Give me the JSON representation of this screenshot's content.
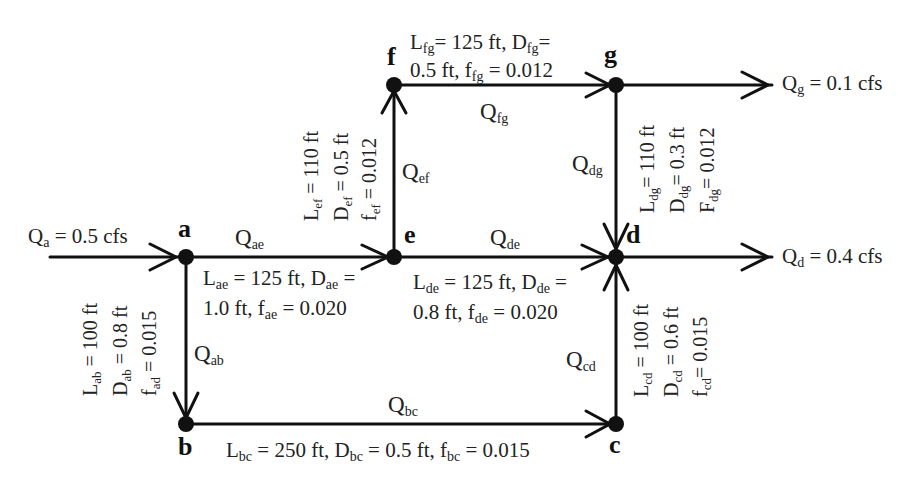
{
  "diagram": {
    "type": "pipe-network",
    "nodes": [
      {
        "id": "a",
        "label": "a"
      },
      {
        "id": "b",
        "label": "b"
      },
      {
        "id": "c",
        "label": "c"
      },
      {
        "id": "d",
        "label": "d"
      },
      {
        "id": "e",
        "label": "e"
      },
      {
        "id": "f",
        "label": "f"
      },
      {
        "id": "g",
        "label": "g"
      }
    ],
    "inflow": {
      "node": "a",
      "label": "Q",
      "sub": "a",
      "value": " = 0.5 cfs"
    },
    "outflows": [
      {
        "node": "g",
        "label": "Q",
        "sub": "g",
        "value": " = 0.1 cfs"
      },
      {
        "node": "d",
        "label": "Q",
        "sub": "d",
        "value": " = 0.4 cfs"
      }
    ],
    "pipes": {
      "ae": {
        "flow": "Q",
        "flow_sub": "ae",
        "from": "a",
        "to": "e",
        "line1_L": "L",
        "line1_Lsub": "ae",
        "line1_Lval": " = 125 ft, D",
        "line1_Dsub": "ae",
        "line1_Dval": " =",
        "line2_Dval": "1.0 ft, f",
        "line2_fsub": "ae",
        "line2_fval": " = 0.020"
      },
      "de": {
        "flow": "Q",
        "flow_sub": "de",
        "from": "e",
        "to": "d",
        "line1_L": "L",
        "line1_Lsub": "de",
        "line1_Lval": " = 125 ft, D",
        "line1_Dsub": "de",
        "line1_Dval": " =",
        "line2_Dval": "0.8 ft, f",
        "line2_fsub": "de",
        "line2_fval": " = 0.020"
      },
      "fg": {
        "flow": "Q",
        "flow_sub": "fg",
        "from": "f",
        "to": "g",
        "line1_L": "L",
        "line1_Lsub": "fg",
        "line1_Lval": "= 125 ft, D",
        "line1_Dsub": "fg",
        "line1_Dval": "=",
        "line2_Dval": "0.5 ft, f",
        "line2_fsub": "fg",
        "line2_fval": " = 0.012"
      },
      "bc": {
        "flow": "Q",
        "flow_sub": "bc",
        "from": "b",
        "to": "c",
        "L": "L",
        "Lsub": "bc",
        "Lval": " = 250 ft, D",
        "Dsub": "bc",
        "Dval": " = 0.5 ft, f",
        "fsub": "bc",
        "fval": " = 0.015"
      },
      "ab": {
        "flow": "Q",
        "flow_sub": "ab",
        "from": "a",
        "to": "b",
        "L": "L",
        "Lsub": "ab",
        "Lval": " = 100 ft",
        "D": "D",
        "Dsub": "ab",
        "Dval": " = 0.8 ft",
        "f": "f",
        "fsub": "ad",
        "fval": " = 0.015"
      },
      "ef": {
        "flow": "Q",
        "flow_sub": "ef",
        "from": "e",
        "to": "f",
        "L": "L",
        "Lsub": "ef",
        "Lval": " = 110 ft",
        "D": "D",
        "Dsub": "ef",
        "Dval": " = 0.5 ft",
        "f": "f",
        "fsub": "ef",
        "fval": " = 0.012"
      },
      "dg": {
        "flow": "Q",
        "flow_sub": "dg",
        "from": "g",
        "to": "d",
        "L": "L",
        "Lsub": "dg",
        "Lval": "= 110 ft",
        "D": "D",
        "Dsub": "dg",
        "Dval": "= 0.3 ft",
        "f": "F",
        "fsub": "dg",
        "fval": "= 0.012"
      },
      "cd": {
        "flow": "Q",
        "flow_sub": "cd",
        "from": "c",
        "to": "d",
        "L": "L",
        "Lsub": "cd",
        "Lval": " = 100 ft",
        "D": "D",
        "Dsub": "cd",
        "Dval": " = 0.6 ft",
        "f": "f",
        "fsub": "cd",
        "fval": "= 0.015"
      }
    }
  }
}
